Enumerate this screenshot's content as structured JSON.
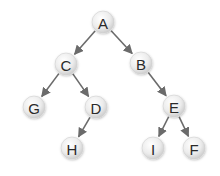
{
  "diagram": {
    "type": "binary-tree",
    "nodes": [
      {
        "id": "A",
        "label": "A",
        "x": 103,
        "y": 22
      },
      {
        "id": "C",
        "label": "C",
        "x": 66,
        "y": 64
      },
      {
        "id": "B",
        "label": "B",
        "x": 141,
        "y": 63
      },
      {
        "id": "G",
        "label": "G",
        "x": 34,
        "y": 107
      },
      {
        "id": "D",
        "label": "D",
        "x": 96,
        "y": 107
      },
      {
        "id": "E",
        "label": "E",
        "x": 174,
        "y": 106
      },
      {
        "id": "H",
        "label": "H",
        "x": 72,
        "y": 148
      },
      {
        "id": "I",
        "label": "I",
        "x": 153,
        "y": 148
      },
      {
        "id": "F",
        "label": "F",
        "x": 194,
        "y": 148
      }
    ],
    "edges": [
      {
        "from": "A",
        "to": "C"
      },
      {
        "from": "A",
        "to": "B"
      },
      {
        "from": "C",
        "to": "G"
      },
      {
        "from": "C",
        "to": "D"
      },
      {
        "from": "D",
        "to": "H"
      },
      {
        "from": "B",
        "to": "E"
      },
      {
        "from": "E",
        "to": "I"
      },
      {
        "from": "E",
        "to": "F"
      }
    ],
    "colors": {
      "edge": "#6b6b6b",
      "node_fill_center": "#ffffff",
      "node_fill_edge": "#d4d4d4",
      "label": "#2a2a2a"
    },
    "node_radius": 11
  }
}
